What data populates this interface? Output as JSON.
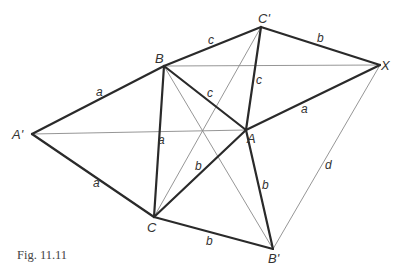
{
  "caption": "Fig. 11.11",
  "vertices": {
    "A_prime": {
      "label": "A'",
      "x": 32,
      "y": 134
    },
    "B": {
      "label": "B",
      "x": 164,
      "y": 66
    },
    "C_prime": {
      "label": "C'",
      "x": 261,
      "y": 27
    },
    "X": {
      "label": "X",
      "x": 380,
      "y": 65
    },
    "A": {
      "label": "A",
      "x": 246,
      "y": 130
    },
    "C": {
      "label": "C",
      "x": 154,
      "y": 217
    },
    "B_prime": {
      "label": "B'",
      "x": 273,
      "y": 249
    }
  },
  "thick_edges": [
    {
      "from": "A_prime",
      "to": "B",
      "label": "a"
    },
    {
      "from": "A_prime",
      "to": "C",
      "label": "a"
    },
    {
      "from": "B",
      "to": "C",
      "label": "a"
    },
    {
      "from": "B",
      "to": "C_prime",
      "label": "c"
    },
    {
      "from": "B",
      "to": "A",
      "label": "c"
    },
    {
      "from": "C_prime",
      "to": "A",
      "label": "c"
    },
    {
      "from": "C_prime",
      "to": "X",
      "label": "b"
    },
    {
      "from": "A",
      "to": "X",
      "label": "a"
    },
    {
      "from": "C",
      "to": "A",
      "label": "b"
    },
    {
      "from": "C",
      "to": "B_prime",
      "label": "b"
    },
    {
      "from": "A",
      "to": "B_prime",
      "label": "b"
    }
  ],
  "thin_edges": [
    {
      "from": "B",
      "to": "X"
    },
    {
      "from": "A_prime",
      "to": "A"
    },
    {
      "from": "C",
      "to": "C_prime"
    },
    {
      "from": "B",
      "to": "B_prime"
    },
    {
      "from": "X",
      "to": "B_prime",
      "label": "d"
    }
  ],
  "edge_labels": {
    "a_AprimeB": "a",
    "a_AprimeC": "a",
    "a_BC": "a",
    "c_BCprime": "c",
    "c_BA": "c",
    "c_CprimeA": "c",
    "b_CprimeX": "b",
    "a_AX": "a",
    "b_CA": "b",
    "b_CBprime": "b",
    "b_ABprime": "b",
    "d_XBprime": "d"
  }
}
